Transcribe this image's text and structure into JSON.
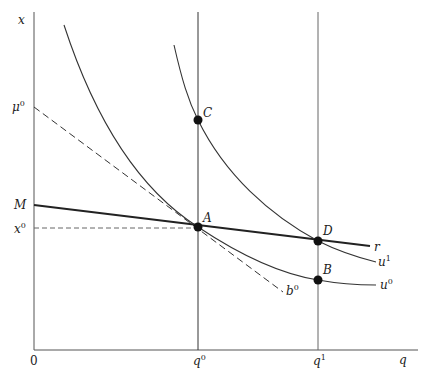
{
  "diagram": {
    "axes": {
      "y_label": "x",
      "x_label": "q",
      "origin_label": "0"
    },
    "y_ticks": [
      {
        "base": "μ",
        "sup": "0",
        "y": 107
      },
      {
        "base": "M",
        "sup": "",
        "y": 205
      },
      {
        "base": "x",
        "sup": "0",
        "y": 228
      }
    ],
    "x_ticks": [
      {
        "base": "q",
        "sup": "0",
        "x": 198
      },
      {
        "base": "q",
        "sup": "1",
        "x": 318
      }
    ],
    "points": [
      {
        "label": "A",
        "x": 198,
        "y": 227
      },
      {
        "label": "C",
        "x": 198,
        "y": 120
      },
      {
        "label": "D",
        "x": 318,
        "y": 241
      },
      {
        "label": "B",
        "x": 318,
        "y": 280
      }
    ],
    "curves": [
      {
        "name": "u⁰",
        "base": "u",
        "sup": "0",
        "style": "solid",
        "description": "lower indifference curve through A and B"
      },
      {
        "name": "u¹",
        "base": "u",
        "sup": "1",
        "style": "solid",
        "description": "higher indifference curve through C and D"
      },
      {
        "name": "r",
        "base": "r",
        "sup": "",
        "style": "bold",
        "description": "line from M through A and D"
      },
      {
        "name": "b⁰",
        "base": "b",
        "sup": "0",
        "style": "dashed",
        "description": "budget line from μ⁰ tangent at A"
      }
    ],
    "guides": [
      {
        "name": "x0-dashed-guide",
        "style": "dashed",
        "from": "x⁰",
        "to": "A"
      },
      {
        "name": "q0-vertical",
        "style": "solid"
      },
      {
        "name": "q1-vertical",
        "style": "solid"
      }
    ]
  }
}
